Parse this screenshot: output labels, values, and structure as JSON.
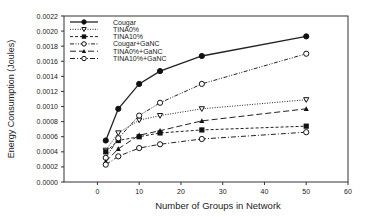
{
  "chart_data": {
    "type": "line",
    "title": "",
    "xlabel": "Number of Groups in Network",
    "ylabel": "Energy Consumption (Joules)",
    "xlim": [
      -8,
      60
    ],
    "ylim": [
      0,
      0.0022
    ],
    "x_ticks": [
      0,
      10,
      20,
      30,
      40,
      50,
      60
    ],
    "y_ticks": [
      "0.0000",
      "0.0002",
      "0.0004",
      "0.0006",
      "0.0008",
      "0.0010",
      "0.0012",
      "0.0014",
      "0.0016",
      "0.0018",
      "0.0020",
      "0.0022"
    ],
    "grid": false,
    "legend_position": "upper-left",
    "x": [
      2,
      5,
      10,
      15,
      25,
      50
    ],
    "series": [
      {
        "name": "Cougar",
        "marker": "filled-circle",
        "dash": "solid",
        "values": [
          0.00055,
          0.00097,
          0.0013,
          0.00147,
          0.00167,
          0.00193
        ]
      },
      {
        "name": "TINA0%",
        "marker": "open-triangle-down",
        "dash": "dotted",
        "values": [
          0.00042,
          0.00065,
          0.00082,
          0.00088,
          0.00097,
          0.00109
        ]
      },
      {
        "name": "TINA10%",
        "marker": "filled-square",
        "dash": "short-dash",
        "values": [
          0.0004,
          0.00055,
          0.0006,
          0.00065,
          0.00069,
          0.00074
        ]
      },
      {
        "name": "Cougar+GaNC",
        "marker": "open-circle",
        "dash": "dash-dot-dot",
        "values": [
          0.00032,
          0.00058,
          0.00088,
          0.00105,
          0.0013,
          0.0017
        ]
      },
      {
        "name": "TINA0%+GaNC",
        "marker": "filled-triangle-up",
        "dash": "long-dash",
        "values": [
          0.00027,
          0.00044,
          0.00062,
          0.00068,
          0.00081,
          0.00097
        ]
      },
      {
        "name": "TINA10%+GaNC",
        "marker": "open-circle",
        "dash": "dash-dot",
        "values": [
          0.00023,
          0.00034,
          0.00045,
          0.0005,
          0.00057,
          0.00066
        ]
      }
    ]
  }
}
